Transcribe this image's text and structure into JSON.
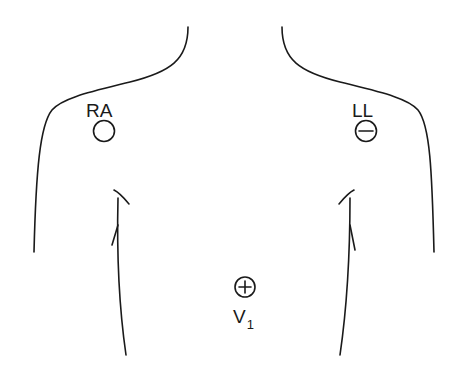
{
  "diagram": {
    "title": "",
    "electrodes": [
      {
        "label": "RA",
        "polarity_symbol": "none",
        "position": "right-shoulder"
      },
      {
        "label": "LL",
        "polarity_symbol": "minus",
        "position": "left-shoulder"
      },
      {
        "label": "V",
        "subscript": "1",
        "polarity_symbol": "plus",
        "position": "chest-center"
      }
    ]
  }
}
